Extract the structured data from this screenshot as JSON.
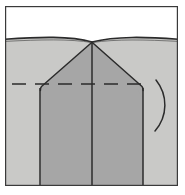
{
  "figure": {
    "title": "Perspective line drawing of a gabled building mass",
    "type": "technical-line-drawing",
    "canvas": {
      "width": 185,
      "height": 195
    },
    "frame": {
      "name": "drawing-border",
      "x": 5,
      "y": 6,
      "width": 173,
      "height": 180,
      "stroke": "#3a3a3a",
      "stroke_width": 1.2,
      "fill": "#ffffff"
    },
    "regions": [
      {
        "name": "sky-band",
        "label": "sky",
        "fill": "#ffffff",
        "x": 5,
        "y": 6,
        "width": 173,
        "height": 33
      },
      {
        "name": "ground-plane",
        "label": "ground",
        "fill": "#c9c9c7",
        "x": 5,
        "y": 39,
        "width": 173,
        "height": 147
      },
      {
        "name": "building-mass",
        "label": "building body",
        "fill": "#a6a6a6",
        "note": "gabled block with chamfered shoulders"
      }
    ],
    "horizon": {
      "name": "horizon-line",
      "y": 40,
      "stroke": "#2b2b2b",
      "stroke_width": 1.6,
      "shape": "slightly-curved",
      "sag": 3
    },
    "apex": {
      "x": 92,
      "y": 42
    },
    "shoulders": {
      "left": {
        "x": 40,
        "y": 88
      },
      "right": {
        "x": 143,
        "y": 88
      }
    },
    "base": {
      "y": 186
    },
    "vertical_edges": [
      {
        "name": "left-wall-edge",
        "x": 40
      },
      {
        "name": "center-ridge-edge",
        "x": 92
      },
      {
        "name": "right-wall-edge",
        "x": 143
      }
    ],
    "dashed_guide": {
      "name": "eave-guide-line",
      "y": 84,
      "x_start": 12,
      "x_end": 150,
      "dash": "14 9",
      "stroke": "#2b2b2b",
      "stroke_width": 1.4
    },
    "curve_annotation": {
      "name": "bracket-curve",
      "stroke": "#2b2b2b",
      "stroke_width": 1.5,
      "top": {
        "x": 156,
        "y": 80
      },
      "bottom": {
        "x": 155,
        "y": 131
      },
      "bulge_x": 168
    },
    "colors": {
      "sky": "#ffffff",
      "ground": "#c9c9c7",
      "building": "#a6a6a6",
      "line": "#2b2b2b",
      "frame": "#3a3a3a",
      "page": "#ffffff"
    }
  }
}
